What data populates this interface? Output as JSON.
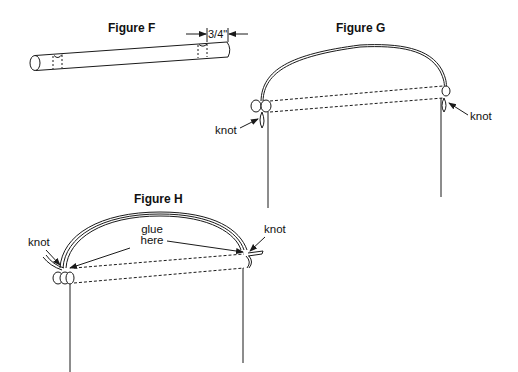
{
  "figures": {
    "f": {
      "title": "Figure F",
      "dimension_label": "3/4\""
    },
    "g": {
      "title": "Figure G",
      "knot_left": "knot",
      "knot_right": "knot"
    },
    "h": {
      "title": "Figure H",
      "knot_left": "knot",
      "knot_right": "knot",
      "glue_line1": "glue",
      "glue_line2": "here"
    }
  },
  "colors": {
    "line": "#1a1a1a",
    "background": "#ffffff"
  }
}
